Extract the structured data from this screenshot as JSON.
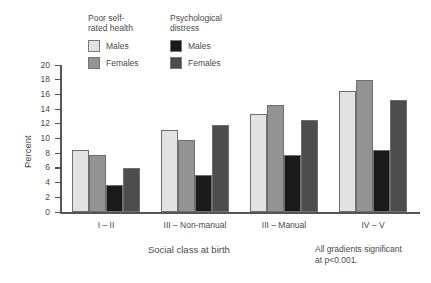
{
  "chart_data": {
    "type": "bar",
    "title": "",
    "xlabel": "Social class at birth",
    "ylabel": "Percent",
    "ylim": [
      0,
      20
    ],
    "yticks": [
      0,
      2,
      4,
      6,
      8,
      10,
      12,
      14,
      16,
      18,
      20
    ],
    "grid": false,
    "legend_position": "top-left",
    "categories": [
      "I – II",
      "III – Non-manual",
      "III – Manual",
      "IV – V"
    ],
    "series": [
      {
        "name": "Poor self-rated health – Males",
        "group": "Poor self-rated health",
        "sex": "Males",
        "color": "#e2e2e2",
        "values": [
          8.5,
          11.2,
          13.3,
          16.5
        ]
      },
      {
        "name": "Poor self-rated health – Females",
        "group": "Poor self-rated health",
        "sex": "Females",
        "color": "#939393",
        "values": [
          7.8,
          9.8,
          14.5,
          18.0
        ]
      },
      {
        "name": "Psychological distress – Males",
        "group": "Psychological distress",
        "sex": "Males",
        "color": "#1a1a1a",
        "values": [
          3.7,
          5.0,
          7.8,
          8.5
        ]
      },
      {
        "name": "Psychological distress – Females",
        "group": "Psychological distress",
        "sex": "Females",
        "color": "#4d4d4d",
        "values": [
          6.0,
          11.9,
          12.5,
          15.2
        ]
      }
    ],
    "annotations": [
      "All gradients significant\nat p<0.001."
    ]
  },
  "legend": {
    "blocks": [
      {
        "title": "Poor self-\nrated health",
        "entries": [
          {
            "label": "Males",
            "color": "#e2e2e2"
          },
          {
            "label": "Females",
            "color": "#939393"
          }
        ]
      },
      {
        "title": "Psychological\ndistress",
        "entries": [
          {
            "label": "Males",
            "color": "#1a1a1a"
          },
          {
            "label": "Females",
            "color": "#4d4d4d"
          }
        ]
      }
    ]
  },
  "axes": {
    "y_title": "Percent",
    "y_ticks": [
      "20",
      "18",
      "16",
      "14",
      "12",
      "10",
      "8",
      "6",
      "4",
      "2",
      "0"
    ],
    "x_title": "Social class at birth",
    "x_labels": [
      "I – II",
      "III – Non-manual",
      "III – Manual",
      "IV – V"
    ]
  },
  "footnote": {
    "text": "All gradients significant\nat p<0.001."
  },
  "colors": {
    "srh_male": "#e2e2e2",
    "srh_female": "#939393",
    "psy_male": "#1a1a1a",
    "psy_female": "#4d4d4d",
    "axis": "#555555",
    "text": "#4a4a4a",
    "background": "#ffffff"
  }
}
